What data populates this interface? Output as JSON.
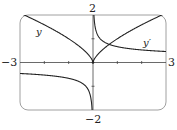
{
  "chart_data": {
    "type": "line",
    "title": "",
    "xlabel": "",
    "ylabel": "",
    "xlim": [
      -3,
      3
    ],
    "ylim": [
      -2,
      2
    ],
    "grid": false,
    "x_ticks": [
      -2,
      -1,
      1,
      2
    ],
    "y_ticks": [
      -1,
      1
    ],
    "axis_labels": {
      "x_min": "−3",
      "x_max": "3",
      "y_max": "2",
      "y_min": "−2"
    },
    "series": [
      {
        "name": "y",
        "expression": "x^(2/3)",
        "label": "y",
        "x": [
          -3,
          -2.5,
          -2,
          -1.5,
          -1,
          -0.5,
          -0.1,
          0,
          0.1,
          0.5,
          1,
          1.5,
          2,
          2.5,
          3
        ],
        "y": [
          2.08,
          1.84,
          1.59,
          1.31,
          1.0,
          0.63,
          0.22,
          0,
          0.22,
          0.63,
          1.0,
          1.31,
          1.59,
          1.84,
          2.08
        ]
      },
      {
        "name": "y'",
        "expression": "(2/3)x^(-1/3)",
        "label": "y′",
        "x": [
          -3,
          -2.5,
          -2,
          -1.5,
          -1,
          -0.5,
          -0.1,
          -0.04,
          0.04,
          0.1,
          0.5,
          1,
          1.5,
          2,
          2.5,
          3
        ],
        "y": [
          -0.46,
          -0.49,
          -0.53,
          -0.58,
          -0.67,
          -0.84,
          -1.44,
          -1.95,
          1.95,
          1.44,
          0.84,
          0.67,
          0.58,
          0.53,
          0.49,
          0.46
        ]
      }
    ]
  }
}
